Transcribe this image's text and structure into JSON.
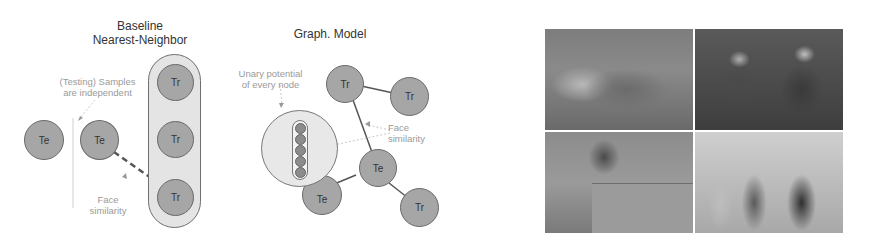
{
  "baseline": {
    "title_line1": "Baseline",
    "title_line2": "Nearest-Neighbor",
    "note_independent_line1": "(Testing) Samples",
    "note_independent_line2": "are independent",
    "note_similarity_line1": "Face",
    "note_similarity_line2": "similarity",
    "test_nodes": [
      "Te",
      "Te"
    ],
    "train_nodes": [
      "Tr",
      "Tr",
      "Tr"
    ]
  },
  "graph_model": {
    "title": "Graph. Model",
    "note_unary_line1": "Unary potential",
    "note_unary_line2": "of every node",
    "note_similarity_line1": "Face",
    "note_similarity_line2": "similarity",
    "nodes": [
      {
        "label": "Tr"
      },
      {
        "label": "Tr"
      },
      {
        "label": "Te"
      },
      {
        "label": "Te"
      },
      {
        "label": "Tr"
      }
    ]
  },
  "photos": {
    "count": 4,
    "items": [
      {
        "desc": "group-sitting-on-rocks"
      },
      {
        "desc": "elderly-couple-at-table"
      },
      {
        "desc": "couple-near-stone-wall"
      },
      {
        "desc": "group-standing-indoors"
      }
    ]
  },
  "colors": {
    "node_fill": "#a6a6a6",
    "node_border": "#6a6a6a",
    "capsule_fill": "#e4e4e4",
    "note_text": "#9a9a9a"
  }
}
